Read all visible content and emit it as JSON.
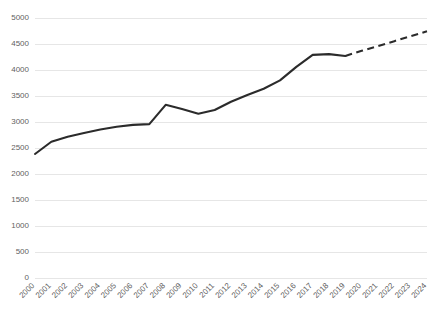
{
  "chart_data": {
    "type": "line",
    "title": "",
    "subtitle": "",
    "xlabel": "",
    "ylabel": "",
    "xlim": [
      2000,
      2024
    ],
    "ylim": [
      0,
      5000
    ],
    "grid": true,
    "legend": false,
    "legend_position": "none",
    "line_color": "#2b2b2b",
    "grid_color": "#e6e6e6",
    "background_color": "#ffffff",
    "tick_label_color": "#5f5f5f",
    "ytick_labels": [
      "0",
      "500",
      "1000",
      "1500",
      "2000",
      "2500",
      "3000",
      "3500",
      "4000",
      "4500",
      "5000"
    ],
    "ytick_values": [
      0,
      500,
      1000,
      1500,
      2000,
      2500,
      3000,
      3500,
      4000,
      4500,
      5000
    ],
    "categories": [
      "2000",
      "2001",
      "2002",
      "2003",
      "2004",
      "2005",
      "2006",
      "2007",
      "2008",
      "2009",
      "2010",
      "2011",
      "2012",
      "2013",
      "2014",
      "2015",
      "2016",
      "2017",
      "2018",
      "2019",
      "2020",
      "2021",
      "2022",
      "2023",
      "2024"
    ],
    "series": [
      {
        "name": "actual",
        "style": "solid",
        "x": [
          "2000",
          "2001",
          "2002",
          "2003",
          "2004",
          "2005",
          "2006",
          "2007",
          "2008",
          "2009",
          "2010",
          "2011",
          "2012",
          "2013",
          "2014",
          "2015",
          "2016",
          "2017",
          "2018",
          "2019"
        ],
        "values": [
          2385,
          2620,
          2715,
          2790,
          2855,
          2910,
          2945,
          2960,
          3330,
          3250,
          3160,
          3230,
          3390,
          3520,
          3640,
          3800,
          4060,
          4290,
          4305,
          4270
        ]
      },
      {
        "name": "projection",
        "style": "dashed",
        "x": [
          "2019",
          "2020",
          "2021",
          "2022",
          "2023",
          "2024"
        ],
        "values": [
          4270,
          4370,
          4460,
          4555,
          4650,
          4745
        ]
      }
    ]
  }
}
